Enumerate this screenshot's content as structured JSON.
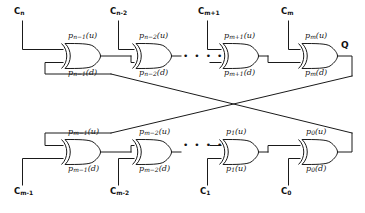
{
  "figure": {
    "output": {
      "label": "Q"
    },
    "ellipsis": {
      "glyph": "• • • •"
    },
    "colors": {
      "wire": "#1a1a1a",
      "background": "#ffffff",
      "gate_fill": "#ffffff"
    }
  },
  "top_row": {
    "inputs": [
      {
        "name": "c-n",
        "base": "C",
        "sub": "n"
      },
      {
        "name": "c-n-2",
        "base": "C",
        "sub": "n-2"
      },
      {
        "name": "c-m-1p",
        "base": "C",
        "sub": "m+1"
      },
      {
        "name": "c-m",
        "base": "C",
        "sub": "m"
      }
    ],
    "gates": [
      {
        "upper_base": "p",
        "upper_sub": "n−1",
        "upper_port": "(u)",
        "lower_base": "p",
        "lower_sub": "n−1",
        "lower_port": "(d)"
      },
      {
        "upper_base": "p",
        "upper_sub": "n−2",
        "upper_port": "(u)",
        "lower_base": "p",
        "lower_sub": "n−2",
        "lower_port": "(d)"
      },
      {
        "upper_base": "p",
        "upper_sub": "m+1",
        "upper_port": "(u)",
        "lower_base": "p",
        "lower_sub": "m+1",
        "lower_port": "(d)"
      },
      {
        "upper_base": "p",
        "upper_sub": "m",
        "upper_port": "(u)",
        "lower_base": "p",
        "lower_sub": "m",
        "lower_port": "(d)"
      }
    ]
  },
  "bottom_row": {
    "inputs": [
      {
        "name": "c-m-1",
        "base": "C",
        "sub": "m-1"
      },
      {
        "name": "c-m-2",
        "base": "C",
        "sub": "m-2"
      },
      {
        "name": "c-1",
        "base": "C",
        "sub": "1"
      },
      {
        "name": "c-0",
        "base": "C",
        "sub": "0"
      }
    ],
    "gates": [
      {
        "upper_base": "p",
        "upper_sub": "m−1",
        "upper_port": "(u)",
        "lower_base": "p",
        "lower_sub": "m−1",
        "lower_port": "(d)"
      },
      {
        "upper_base": "p",
        "upper_sub": "m−2",
        "upper_port": "(u)",
        "lower_base": "p",
        "lower_sub": "m−2",
        "lower_port": "(d)"
      },
      {
        "upper_base": "p",
        "upper_sub": "1",
        "upper_port": "(u)",
        "lower_base": "p",
        "lower_sub": "1",
        "lower_port": "(u)"
      },
      {
        "upper_base": "p",
        "upper_sub": "0",
        "upper_port": "(u)",
        "lower_base": "p",
        "lower_sub": "0",
        "lower_port": "(d)"
      }
    ]
  }
}
